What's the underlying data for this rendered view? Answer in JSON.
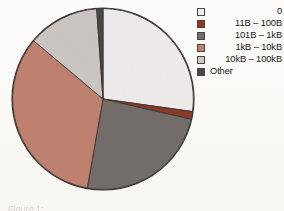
{
  "figure": {
    "background_color": "#fbfaf8",
    "caption_fragment": "Figure 1:"
  },
  "legend": {
    "position": "right",
    "items": [
      {
        "label": "0",
        "color": "#efeceb",
        "swatch_name": "legend-swatch-0"
      },
      {
        "label": "11B – 100B",
        "color": "#8c3a28",
        "swatch_name": "legend-swatch-11b-100b"
      },
      {
        "label": "101B – 1kB",
        "color": "#756e6c",
        "swatch_name": "legend-swatch-101b-1kb"
      },
      {
        "label": "1kB – 10kB",
        "color": "#c08270",
        "swatch_name": "legend-swatch-1kb-10kb"
      },
      {
        "label": "10kB – 100kB",
        "color": "#cdc7c4",
        "swatch_name": "legend-swatch-10kb-100kb"
      },
      {
        "label": "Other",
        "color": "#4b4745",
        "swatch_name": "legend-swatch-other"
      }
    ]
  },
  "chart_data": {
    "type": "pie",
    "title": "",
    "categories": [
      "0",
      "11B – 100B",
      "101B – 1kB",
      "1kB – 10kB",
      "10kB – 100kB",
      "Other"
    ],
    "values": [
      27.2,
      1.4,
      24.2,
      33.3,
      12.8,
      1.1
    ],
    "unit": "percent",
    "start_angle_deg": 0,
    "direction": "clockwise",
    "colors": [
      "#efeceb",
      "#8c3a28",
      "#756e6c",
      "#c08270",
      "#cdc7c4",
      "#4b4745"
    ],
    "slice_angles_deg": [
      {
        "name": "0",
        "start": 0,
        "end": 98.0
      },
      {
        "name": "11B – 100B",
        "start": 98.0,
        "end": 103.0
      },
      {
        "name": "101B – 1kB",
        "start": 103.0,
        "end": 190.0
      },
      {
        "name": "1kB – 10kB",
        "start": 190.0,
        "end": 310.0
      },
      {
        "name": "10kB – 100kB",
        "start": 310.0,
        "end": 356.0
      },
      {
        "name": "Other",
        "start": 356.0,
        "end": 360.0
      }
    ],
    "legend_position": "right",
    "grid": false,
    "xlabel": "",
    "ylabel": ""
  }
}
